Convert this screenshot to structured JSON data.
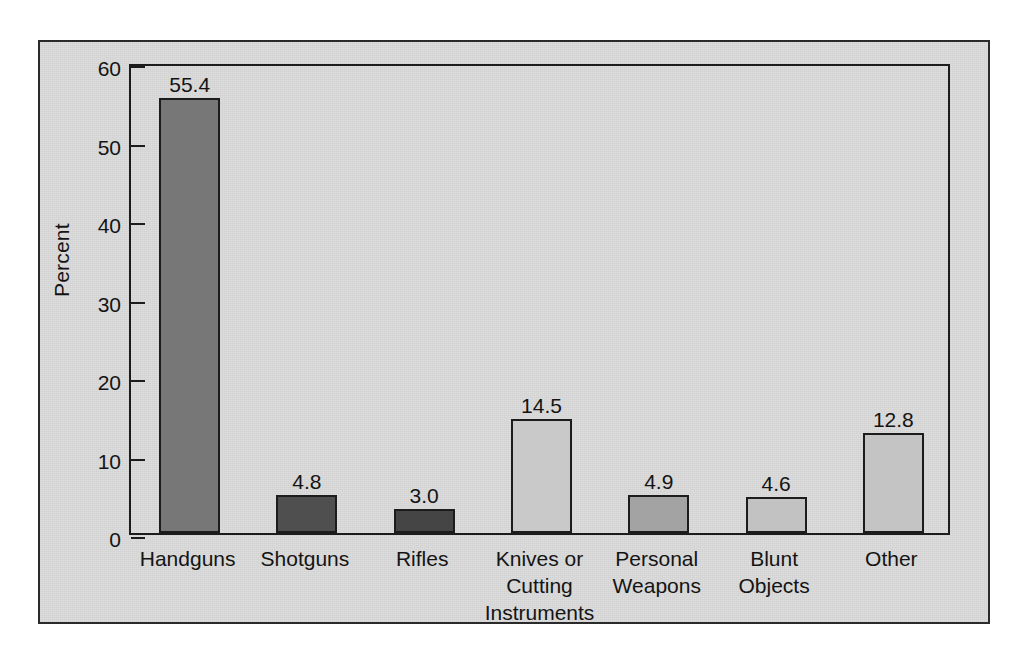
{
  "chart_data": {
    "type": "bar",
    "title": "",
    "xlabel": "",
    "ylabel": "Percent",
    "ylim": [
      0,
      60
    ],
    "yticks": [
      0,
      10,
      20,
      30,
      40,
      50,
      60
    ],
    "ytick_labels": [
      "0",
      "10",
      "20",
      "30",
      "40",
      "50",
      "60"
    ],
    "grid": false,
    "legend": "none",
    "value_labels_shown": true,
    "categories": [
      "Handguns",
      "Shotguns",
      "Rifles",
      "Knives or Cutting Instruments",
      "Personal Weapons",
      "Blunt Objects",
      "Other"
    ],
    "category_label_lines": [
      [
        "Handguns"
      ],
      [
        "Shotguns"
      ],
      [
        "Rifles"
      ],
      [
        "Knives or",
        "Cutting",
        "Instruments"
      ],
      [
        "Personal",
        "Weapons"
      ],
      [
        "Blunt",
        "Objects"
      ],
      [
        "Other"
      ]
    ],
    "values": [
      55.4,
      4.8,
      3.0,
      14.5,
      4.9,
      4.6,
      12.8
    ],
    "value_label_text": [
      "55.4",
      "4.8",
      "3.0",
      "14.5",
      "4.9",
      "4.6",
      "12.8"
    ],
    "bar_colors": [
      "#777777",
      "#4f4f4f",
      "#454545",
      "#c9c9c9",
      "#a3a3a3",
      "#c2c2c2",
      "#c4c4c4"
    ]
  },
  "style": {
    "panel_background": "#dcdcdc",
    "axis_color": "#1c1c1c",
    "text_color": "#141414"
  }
}
